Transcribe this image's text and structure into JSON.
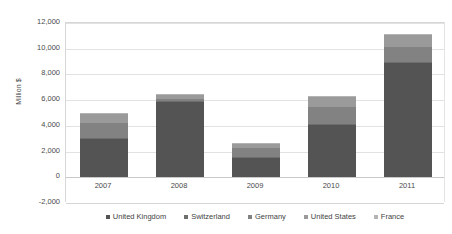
{
  "chart_data": {
    "type": "bar",
    "stacked": true,
    "title": "",
    "subtitle": "",
    "xlabel": "",
    "ylabel": "Million $",
    "categories": [
      "2007",
      "2008",
      "2009",
      "2010",
      "2011"
    ],
    "ylim": [
      -2000,
      12000
    ],
    "ytick_step": 2000,
    "ytick_labels": [
      "12,000",
      "10,000",
      "8,000",
      "6,000",
      "4,000",
      "2,000",
      "0",
      "-2,000"
    ],
    "ytick_values": [
      12000,
      10000,
      8000,
      6000,
      4000,
      2000,
      0,
      -2000
    ],
    "grid": true,
    "legend_position": "bottom",
    "series": [
      {
        "name": "United Kingdom",
        "color": "#545454",
        "values": [
          2980,
          5880,
          1540,
          4080,
          8870
        ]
      },
      {
        "name": "Switzerland",
        "color": "#6e6e6e",
        "values": [
          60,
          70,
          60,
          80,
          110
        ]
      },
      {
        "name": "Germany",
        "color": "#828282",
        "values": [
          1190,
          140,
          650,
          1280,
          1150
        ]
      },
      {
        "name": "United States",
        "color": "#9a9a9a",
        "values": [
          700,
          370,
          340,
          820,
          930
        ]
      },
      {
        "name": "France",
        "color": "#b4b4b4",
        "values": [
          60,
          50,
          60,
          50,
          110
        ]
      }
    ],
    "totals": [
      4990,
      6510,
      2650,
      6310,
      11170
    ]
  },
  "legend": {
    "items": [
      {
        "label": "United Kingdom"
      },
      {
        "label": "Switzerland"
      },
      {
        "label": "Germany"
      },
      {
        "label": "United States"
      },
      {
        "label": "France"
      }
    ]
  }
}
